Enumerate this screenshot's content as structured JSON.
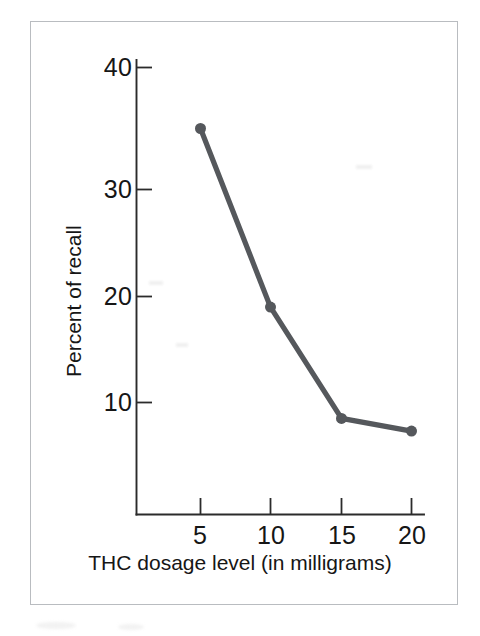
{
  "figure": {
    "background_color": "#ffffff",
    "frame_color": "#b9bcc0",
    "axis_color": "#2b2b2b"
  },
  "chart_data": {
    "type": "line",
    "title": "",
    "subtitle": "",
    "xlabel": "THC dosage level (in milligrams)",
    "ylabel": "Percent of recall",
    "x": [
      5,
      10,
      15,
      20
    ],
    "values": [
      35,
      19,
      8.5,
      7.3
    ],
    "series": [
      {
        "name": "Percent of recall",
        "color": "#55585c",
        "values": [
          35,
          19,
          8.5,
          7.3
        ]
      }
    ],
    "xtick_labels": [
      "5",
      "10",
      "15",
      "20"
    ],
    "ytick_labels": [
      "10",
      "20",
      "30",
      "40"
    ],
    "xticks": [
      5,
      10,
      15,
      20
    ],
    "yticks": [
      10,
      20,
      30,
      40
    ],
    "xlim": [
      2.5,
      21.5
    ],
    "ylim": [
      0,
      41
    ],
    "grid": false,
    "legend": false,
    "legend_position": "none",
    "marker": "circle",
    "marker_size": 11,
    "line_width": 5.2,
    "annotations": []
  },
  "axes": {
    "y_tick_0": "10",
    "y_tick_1": "20",
    "y_tick_2": "30",
    "y_tick_3": "40",
    "x_tick_0": "5",
    "x_tick_1": "10",
    "x_tick_2": "15",
    "x_tick_3": "20",
    "x_title": "THC dosage level (in milligrams)",
    "y_title": "Percent of recall"
  }
}
